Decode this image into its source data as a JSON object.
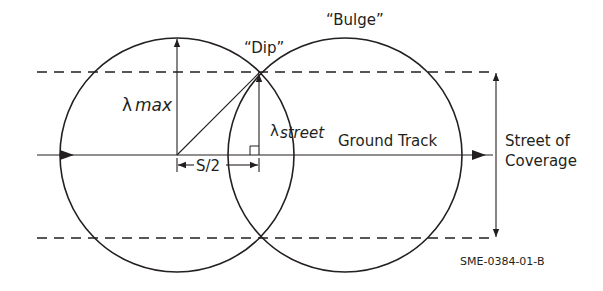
{
  "diagram": {
    "type": "coverage-geometry",
    "labels": {
      "dip": "“Dip”",
      "bulge": "“Bulge”",
      "lambda_max_symbol": "λ",
      "lambda_max_sub": "max",
      "lambda_street_symbol": "λ",
      "lambda_street_sub": "street",
      "ground_track": "Ground Track",
      "half_spacing": "S/2",
      "street_line1": "Street of",
      "street_line2": "Coverage",
      "figure_id": "SME-0384-01-B"
    },
    "colors": {
      "line": "#231f20",
      "background": "#ffffff"
    },
    "geometry": {
      "left_circle": {
        "cx": 177,
        "cy": 155,
        "r": 117
      },
      "right_circle": {
        "cx": 345,
        "cy": 155,
        "r": 117
      },
      "ground_track_y": 155,
      "dashed_top_y": 72,
      "dashed_bottom_y": 238,
      "dip_point": {
        "x": 259,
        "y": 73
      }
    }
  }
}
